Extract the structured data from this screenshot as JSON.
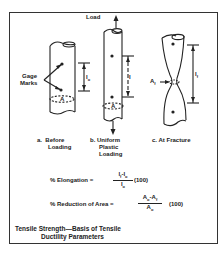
{
  "figure": {
    "labels": {
      "load": "Load",
      "gage_marks_1": "Gage",
      "gage_marks_2": "Marks",
      "lo": "l",
      "lo_sub": "o",
      "l": "l",
      "lf": "l",
      "lf_sub": "f",
      "area": "A",
      "area_f": "A",
      "area_f_sub": "f"
    },
    "panels": [
      {
        "letter": "a.",
        "line1": "Before",
        "line2": "Loading"
      },
      {
        "letter": "b.",
        "line1": "Uniform",
        "line2": "Plastic",
        "line3": "Loading"
      },
      {
        "letter": "c.",
        "line1": "At Fracture"
      }
    ],
    "equations": {
      "elongation": {
        "lhs": "% Elongation =",
        "num": "lf-lo",
        "den": "lo",
        "factor": "(100)"
      },
      "reduction": {
        "lhs": "% Reduction of Area =",
        "num": "Ao-Af",
        "den": "Ao",
        "factor": "(100)"
      }
    },
    "caption": {
      "line1": "Tensile Strength—Basis of Tensile",
      "line2": "Ductility Parameters"
    }
  }
}
